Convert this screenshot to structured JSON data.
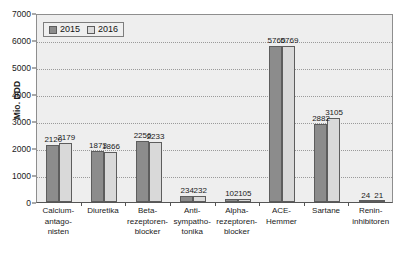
{
  "chart_data": {
    "type": "bar",
    "title": "",
    "xlabel": "",
    "ylabel": "Mio. DDD",
    "ylim": [
      0,
      7000
    ],
    "grid": true,
    "legend_position": "top-left",
    "categories": [
      "Calcium-\nantago-\nnisten",
      "Diuretika",
      "Beta-\nrezeptoren-\nblocker",
      "Anti-\nsympatho-\ntonika",
      "Alpha-\nrezeptoren-\nblocker",
      "ACE-\nHemmer",
      "Sartane",
      "Renin-\ninhibitoren"
    ],
    "yticks": [
      0,
      1000,
      2000,
      3000,
      4000,
      5000,
      6000,
      7000
    ],
    "series": [
      {
        "name": "2015",
        "color": "#8c8c8c",
        "values": [
          2120,
          1873,
          2256,
          234,
          102,
          5760,
          2882,
          24
        ]
      },
      {
        "name": "2016",
        "color": "#d9d9d9",
        "values": [
          2179,
          1866,
          2233,
          232,
          105,
          5769,
          3105,
          21
        ]
      }
    ]
  },
  "legend": {
    "items": [
      {
        "label": "2015",
        "color": "#8c8c8c"
      },
      {
        "label": "2016",
        "color": "#dcdcdc"
      }
    ]
  },
  "axis": {
    "y_title": "Mio. DDD",
    "y_tick_labels": [
      "7000",
      "6000",
      "5000",
      "4000",
      "3000",
      "2000",
      "1000",
      "0"
    ]
  },
  "categories_display": [
    {
      "line1": "Calcium-",
      "line2": "antago-",
      "line3": "nisten"
    },
    {
      "line1": "Diuretika",
      "line2": "",
      "line3": ""
    },
    {
      "line1": "Beta-",
      "line2": "rezeptoren-",
      "line3": "blocker"
    },
    {
      "line1": "Anti-",
      "line2": "sympatho-",
      "line3": "tonika"
    },
    {
      "line1": "Alpha-",
      "line2": "rezeptoren-",
      "line3": "blocker"
    },
    {
      "line1": "ACE-",
      "line2": "Hemmer",
      "line3": ""
    },
    {
      "line1": "Sartane",
      "line2": "",
      "line3": ""
    },
    {
      "line1": "Renin-",
      "line2": "inhibitoren",
      "line3": ""
    }
  ],
  "bar_value_labels": {
    "s2015": [
      "2120",
      "1873",
      "2256",
      "234",
      "102",
      "5760",
      "2882",
      "24"
    ],
    "s2016": [
      "2179",
      "1866",
      "2233",
      "232",
      "105",
      "5769",
      "3105",
      "21"
    ]
  },
  "colors": {
    "series_2015": "#8c8c8c",
    "series_2016": "#d9d9d9",
    "plot_background": "#eeeeee",
    "page_background": "#ffffff",
    "gridline": "#9a9a9a",
    "axis": "#555555",
    "text": "#1a1a1a"
  }
}
